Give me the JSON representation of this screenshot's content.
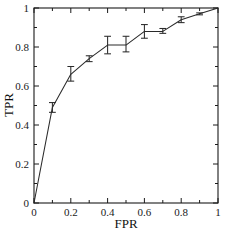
{
  "chart_data": {
    "type": "line",
    "title": "",
    "subtitle": "",
    "xlabel": "FPR",
    "ylabel": "TPR",
    "xlim": [
      0,
      1
    ],
    "ylim": [
      0,
      1
    ],
    "xticks": [
      0,
      0.2,
      0.4,
      0.6,
      0.8,
      1
    ],
    "xtick_labels": [
      "0",
      "0.2",
      "0.4",
      "0.6",
      "0.8",
      "1"
    ],
    "yticks": [
      0,
      0.2,
      0.4,
      0.6,
      0.8,
      1
    ],
    "ytick_labels": [
      "0",
      "0.2",
      "0.4",
      "0.6",
      "0.8",
      "1"
    ],
    "minor_ticks": true,
    "grid": false,
    "legend": null,
    "legend_position": "none",
    "errorbars": true,
    "series": [
      {
        "name": "ROC curve",
        "x": [
          0,
          0.1,
          0.2,
          0.3,
          0.4,
          0.5,
          0.6,
          0.7,
          0.8,
          0.9,
          1
        ],
        "y": [
          0,
          0.49,
          0.66,
          0.74,
          0.81,
          0.81,
          0.88,
          0.88,
          0.94,
          0.97,
          1
        ],
        "yerr_low": [
          0,
          0.465,
          0.625,
          0.725,
          0.765,
          0.775,
          0.845,
          0.87,
          0.925,
          0.965,
          1
        ],
        "yerr_high": [
          0,
          0.515,
          0.7,
          0.755,
          0.855,
          0.855,
          0.915,
          0.895,
          0.955,
          0.975,
          1
        ],
        "color": "#2a2a2a"
      }
    ]
  },
  "axes": {
    "x_label": "FPR",
    "y_label": "TPR"
  }
}
